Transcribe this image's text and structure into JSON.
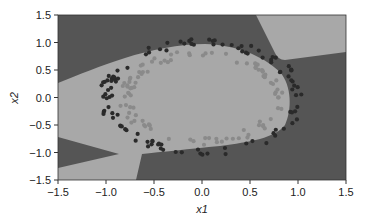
{
  "chart_data": {
    "type": "scatter",
    "title": "",
    "xlabel": "x1",
    "ylabel": "x2",
    "xlim": [
      -1.5,
      1.5
    ],
    "ylim": [
      -1.5,
      1.5
    ],
    "x_ticks": [
      "-1.5",
      "-1.0",
      "-0.5",
      "0.0",
      "0.5",
      "1.0",
      "1.5"
    ],
    "y_ticks": [
      "1.5",
      "1.0",
      "0.5",
      "0.0",
      "-0.5",
      "-1.0",
      "-1.5"
    ],
    "grid": false,
    "legend": null,
    "background": "decision regions (dark = outer class, light = inner class)",
    "colors": {
      "dark_region": "#555555",
      "light_region": "#a8a8a8",
      "outer_points": "#2a2a2a",
      "inner_points": "#8a8a8a"
    },
    "series": [
      {
        "name": "outer ring",
        "radius_approx": 1.0,
        "color": "#2a2a2a"
      },
      {
        "name": "inner ring",
        "radius_approx": 0.8,
        "color": "#8a8a8a"
      }
    ]
  },
  "axes": {
    "xlabel": "x1",
    "ylabel": "x2"
  }
}
